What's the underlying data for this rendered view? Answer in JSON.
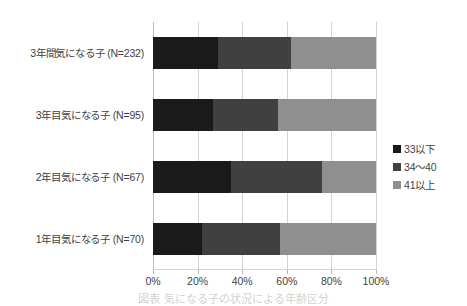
{
  "chart_data": {
    "type": "bar",
    "orientation": "horizontal",
    "stacked": "100%",
    "title": "",
    "xlabel": "",
    "ylabel": "",
    "xlim": [
      0,
      100
    ],
    "grid": true,
    "legend_position": "right",
    "categories": [
      "3年間気になる子 (N=232)",
      "3年目気になる子 (N=95)",
      "2年目気になる子 (N=67)",
      "1年目気になる子 (N=70)"
    ],
    "tick_labels": [
      "0%",
      "20%",
      "40%",
      "60%",
      "80%",
      "100%"
    ],
    "tick_values": [
      0,
      20,
      40,
      60,
      80,
      100
    ],
    "series": [
      {
        "name": "33以下",
        "color": "#1a1a1a",
        "values": [
          29,
          27,
          35,
          22
        ]
      },
      {
        "name": "34～40",
        "color": "#404040",
        "values": [
          33,
          29,
          41,
          35
        ]
      },
      {
        "name": "41以上",
        "color": "#8f8f8f",
        "values": [
          38,
          44,
          24,
          43
        ]
      }
    ]
  },
  "legend": {
    "items": [
      {
        "label": "33以下",
        "color": "#1a1a1a"
      },
      {
        "label": "34～40",
        "color": "#404040"
      },
      {
        "label": "41以上",
        "color": "#8f8f8f"
      }
    ]
  },
  "caption": {
    "text": "図表 気になる子の状況による年齢区分"
  }
}
